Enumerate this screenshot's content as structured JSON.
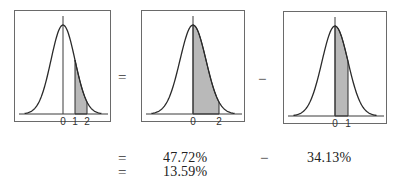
{
  "figure": {
    "panels": [
      {
        "id": "panel-1",
        "shaded_from": 1,
        "shaded_to": 2,
        "tick_labels": [
          {
            "z": 0,
            "label": "0"
          },
          {
            "z": 1,
            "label": "1"
          },
          {
            "z": 2,
            "label": "2"
          }
        ]
      },
      {
        "id": "panel-2",
        "shaded_from": 0,
        "shaded_to": 2,
        "tick_labels": [
          {
            "z": 0,
            "label": "0"
          },
          {
            "z": 2,
            "label": "2"
          }
        ]
      },
      {
        "id": "panel-3",
        "shaded_from": 0,
        "shaded_to": 1,
        "tick_labels": [
          {
            "z": 0,
            "label": "0"
          },
          {
            "z": 1,
            "label": "1"
          }
        ]
      }
    ],
    "operators": {
      "between_1_2": "=",
      "between_2_3": "−"
    },
    "equation": {
      "row1": {
        "operator": "=",
        "left_value": "47.72%",
        "minus": "−",
        "right_value": "34.13%"
      },
      "row2": {
        "operator": "=",
        "result_value": "13.59%"
      }
    },
    "colors": {
      "curve": "#2a2a2a",
      "shading": "#b9b9b9",
      "border": "#6a6a6a",
      "axis": "#3a3a3a"
    }
  }
}
